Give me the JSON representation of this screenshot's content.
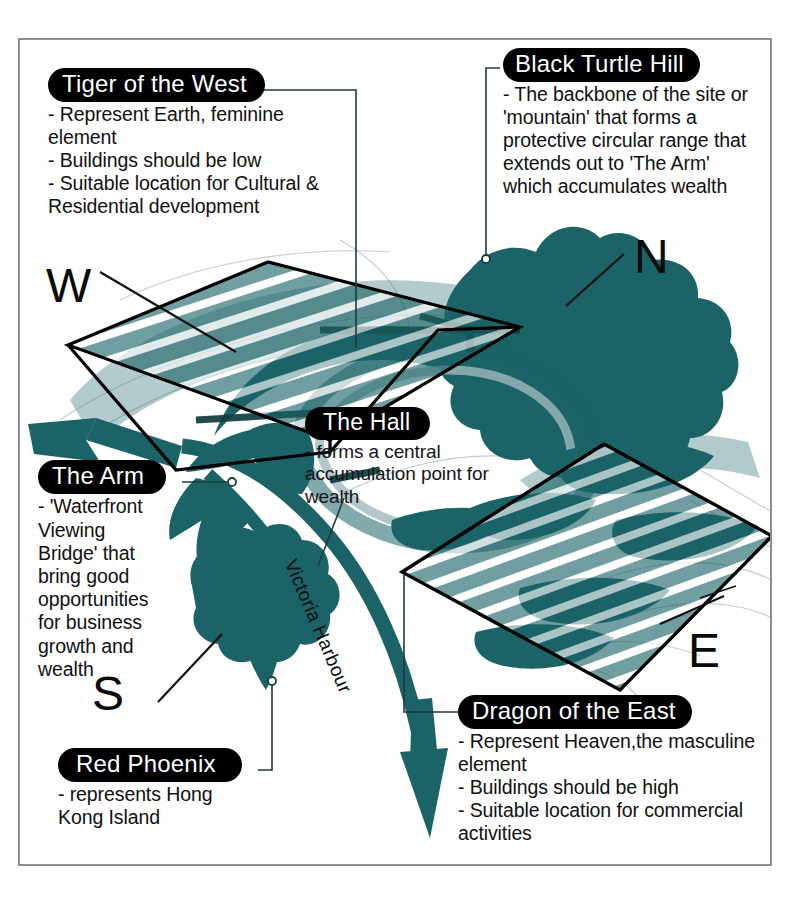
{
  "diagram": {
    "accent_teal": "#1b6366",
    "pill_background": "#000000",
    "pill_text_color": "#ffffff",
    "frame_color": "#8d8d8d"
  },
  "callouts": [
    {
      "id": "tiger-of-the-west",
      "title": "Tiger of the West",
      "body": "- Represent Earth, feminine\nelement\n- Buildings should be low\n- Suitable location for Cultural &\nResidential development"
    },
    {
      "id": "black-turtle-hill",
      "title": "Black Turtle Hill",
      "body": "- The backbone of the site or\n'mountain' that forms a\nprotective circular range that\nextends out to 'The Arm'\nwhich accumulates wealth"
    },
    {
      "id": "the-hall",
      "title": "The Hall",
      "body": "- forms a central\naccumulation point for\nwealth"
    },
    {
      "id": "the-arm",
      "title": "The Arm",
      "body": "- 'Waterfront\nViewing\nBridge' that\nbring good\nopportunities\nfor business\ngrowth and\nwealth"
    },
    {
      "id": "dragon-of-the-east",
      "title": "Dragon of the East",
      "body": "- Represent Heaven,the masculine\nelement\n- Buildings should be high\n- Suitable location for commercial\nactivities"
    },
    {
      "id": "red-phoenix",
      "title": "Red Phoenix",
      "body": "- represents Hong\nKong Island"
    }
  ],
  "compass": {
    "west": "W",
    "north": "N",
    "south": "S",
    "east": "E"
  },
  "map_labels": {
    "harbour": "Victoria Harbour"
  }
}
